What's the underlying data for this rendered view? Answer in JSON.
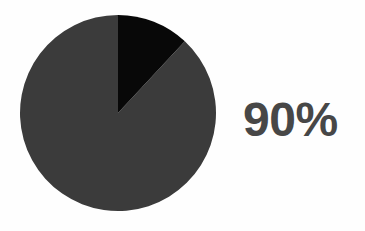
{
  "background_color": "#fefefe",
  "callout": {
    "value_label": "90%",
    "text_color": "#474747"
  },
  "chart_data": {
    "type": "pie",
    "title": "",
    "subtitle": "",
    "xlabel": "",
    "ylabel": "",
    "legend_position": "none",
    "grid": false,
    "start_angle_deg": 0,
    "direction": "clockwise",
    "center": {
      "x": 118,
      "y": 113
    },
    "radius": 98,
    "labels": [
      "Main share",
      "Remainder"
    ],
    "values": [
      88,
      12
    ],
    "display_value": "90%",
    "slices": [
      {
        "label": "Main share",
        "value": 88,
        "percent": 88,
        "color": "#3b3b3b",
        "start_angle_deg": 43,
        "end_angle_deg": 360
      },
      {
        "label": "Remainder",
        "value": 12,
        "percent": 12,
        "color": "#080808",
        "start_angle_deg": 0,
        "end_angle_deg": 43
      }
    ],
    "annotations": [
      {
        "text": "90%",
        "position": "right-of-chart"
      }
    ]
  }
}
